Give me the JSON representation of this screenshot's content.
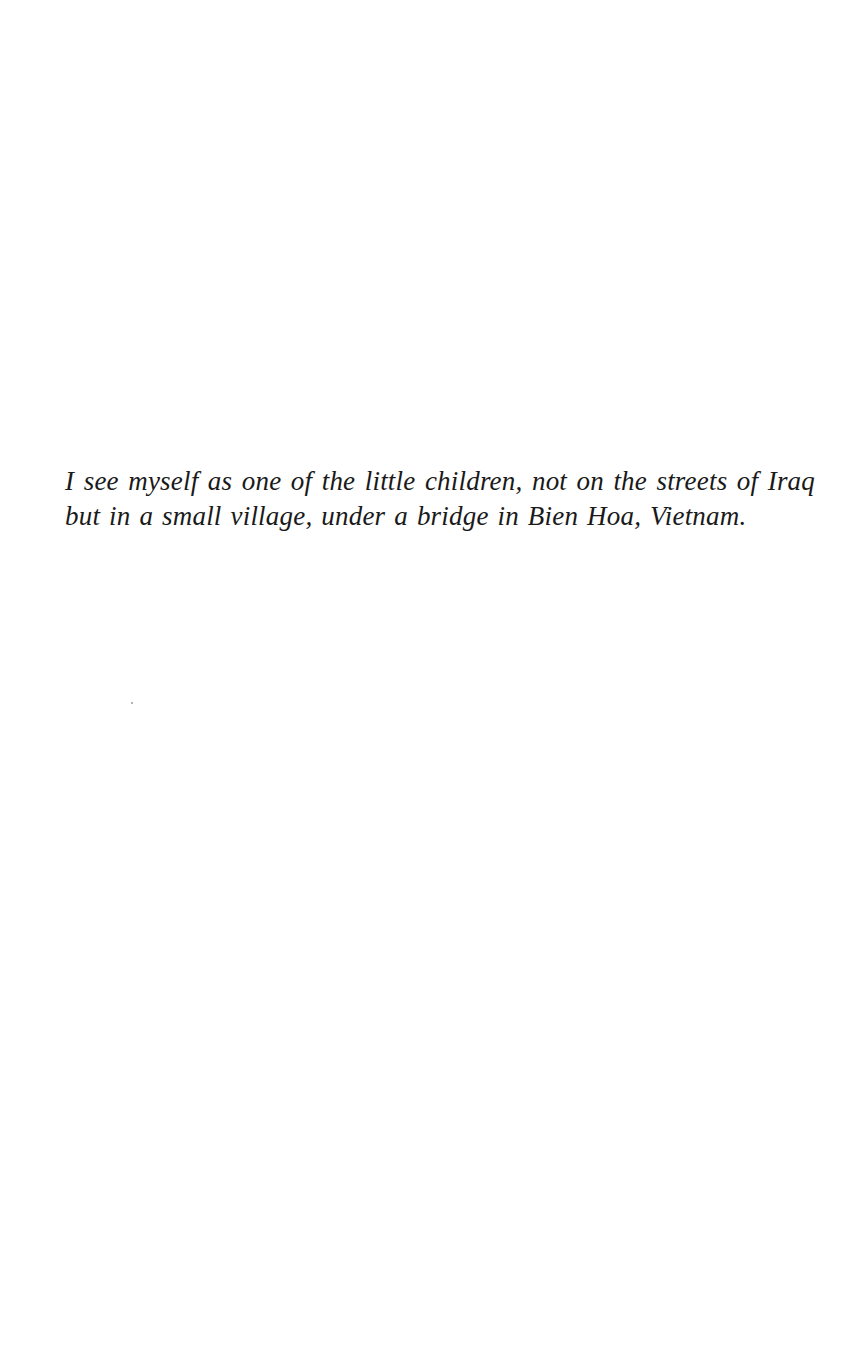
{
  "page": {
    "passage": "I see myself as one of the little children, not on the streets of Iraq but in a small village, under a bridge in Bien Hoa, Vietnam."
  }
}
